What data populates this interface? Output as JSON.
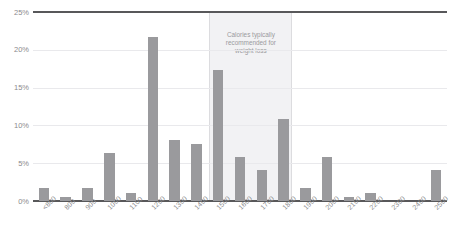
{
  "chart_data": {
    "type": "bar",
    "title": "",
    "subtitle": "",
    "xlabel": "",
    "ylabel": "",
    "ylim": [
      0,
      25
    ],
    "ytick_labels": [
      "0%",
      "5%",
      "10%",
      "15%",
      "20%",
      "25%"
    ],
    "ytick_values": [
      0,
      5,
      10,
      15,
      20,
      25
    ],
    "grid": true,
    "legend": "none",
    "categories": [
      "<800",
      "800",
      "900",
      "1000",
      "1100",
      "1200",
      "1300",
      "1400",
      "1500",
      "1600",
      "1700",
      "1800",
      "1900",
      "2000",
      "2100",
      "2200",
      "2300",
      "2400",
      "2500"
    ],
    "values": [
      1.7,
      0.5,
      1.7,
      6.3,
      1.1,
      21.7,
      8.1,
      7.5,
      17.3,
      5.8,
      4.1,
      10.9,
      1.7,
      5.8,
      0.5,
      1.1,
      0,
      0,
      4.1
    ],
    "bar_color": "#9a9a9d",
    "axis_color": "#58585a",
    "gridline_color": "#e9e9ec",
    "annotations": [
      {
        "name": "recommended-band",
        "text": "Calories typically recommended for weight loss",
        "text_lines": [
          "Calories typically",
          "recommended for",
          "weight loss"
        ],
        "from_category": "1500",
        "to_category": "1800",
        "fill_color": "#f2f2f4",
        "border_color": "#dcdcdf",
        "text_color": "#9a9a9d"
      }
    ]
  },
  "axis": {
    "y_labels": [
      "25%",
      "20%",
      "15%",
      "10%",
      "5%",
      "0%"
    ],
    "x_labels": [
      "<800",
      "800",
      "900",
      "1000",
      "1100",
      "1200",
      "1300",
      "1400",
      "1500",
      "1600",
      "1700",
      "1800",
      "1900",
      "2000",
      "2100",
      "2200",
      "2300",
      "2400",
      "2500"
    ]
  },
  "annotation": {
    "line1": "Calories typically",
    "line2": "recommended for",
    "line3": "weight loss"
  }
}
